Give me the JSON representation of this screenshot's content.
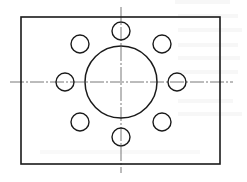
{
  "diagram": {
    "type": "engineering-drawing",
    "title": "",
    "colors": {
      "background": "#ffffff",
      "outline": "#1a1a1a",
      "centerline": "#555555",
      "bleed_text": "#e6e6e6"
    },
    "plate": {
      "x": 21,
      "y": 17,
      "width": 199,
      "height": 147
    },
    "center": {
      "x": 121,
      "y": 82
    },
    "centerlines": {
      "vertical": {
        "x": 121,
        "y1": 7,
        "y2": 173
      },
      "horizontal": {
        "y": 82,
        "x1": 10,
        "x2": 233
      }
    },
    "large_circle": {
      "cx": 121,
      "cy": 82,
      "r": 36
    },
    "bolt_circle_radius": 56,
    "small_holes": [
      {
        "name": "top",
        "cx": 121,
        "cy": 31,
        "r": 9
      },
      {
        "name": "top-right",
        "cx": 162,
        "cy": 44,
        "r": 9
      },
      {
        "name": "right",
        "cx": 177,
        "cy": 82,
        "r": 9
      },
      {
        "name": "bottom-right",
        "cx": 162,
        "cy": 122,
        "r": 9
      },
      {
        "name": "bottom",
        "cx": 121,
        "cy": 137,
        "r": 9
      },
      {
        "name": "bottom-left",
        "cx": 80,
        "cy": 122,
        "r": 9
      },
      {
        "name": "left",
        "cx": 65,
        "cy": 82,
        "r": 9
      },
      {
        "name": "top-left",
        "cx": 80,
        "cy": 44,
        "r": 9
      }
    ]
  }
}
